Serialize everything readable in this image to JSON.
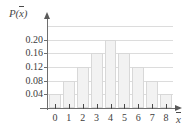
{
  "figure": {
    "y_axis_title_prefix": "P(",
    "y_axis_title_var": "x",
    "y_axis_title_suffix": ")",
    "x_axis_title": "x",
    "accent_color": "#f2f2f2",
    "border_color": "#d8d8d8",
    "axis_color": "#6e6e6e",
    "grid_color": "#dcdcdc"
  },
  "chart_data": {
    "type": "bar",
    "title": "",
    "subtitle": "",
    "xlabel": "x̄",
    "ylabel": "P(x̄)",
    "categories": [
      "0",
      "1",
      "2",
      "3",
      "4",
      "5",
      "6",
      "7",
      "8"
    ],
    "values": [
      0.04,
      0.08,
      0.12,
      0.16,
      0.2,
      0.16,
      0.12,
      0.08,
      0.04
    ],
    "series": [
      {
        "name": "P(x̄)",
        "values": [
          0.04,
          0.08,
          0.12,
          0.16,
          0.2,
          0.16,
          0.12,
          0.08,
          0.04
        ]
      }
    ],
    "ylim": [
      0,
      0.24
    ],
    "xlim": [
      -0.5,
      8.5
    ],
    "y_ticks": [
      0.04,
      0.08,
      0.12,
      0.16,
      0.2
    ],
    "y_tick_labels": [
      "0.04",
      "0.08",
      "0.12",
      "0.16",
      "0.20"
    ],
    "x_ticks": [
      0,
      1,
      2,
      3,
      4,
      5,
      6,
      7,
      8
    ],
    "x_tick_labels": [
      "0",
      "1",
      "2",
      "3",
      "4",
      "5",
      "6",
      "7",
      "8"
    ],
    "gridlines": [
      0.04,
      0.08,
      0.12,
      0.16,
      0.2,
      0.24
    ],
    "grid": true,
    "legend": null,
    "annotations": []
  }
}
